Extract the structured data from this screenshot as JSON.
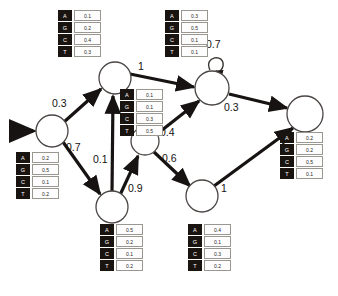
{
  "diagram": {
    "alphabet": [
      "A",
      "G",
      "C",
      "T"
    ],
    "nodes": [
      {
        "id": "start",
        "label": "",
        "cx": 52,
        "cy": 131,
        "r": 16
      },
      {
        "id": "top",
        "label": "",
        "cx": 115,
        "cy": 78,
        "r": 16
      },
      {
        "id": "bottom",
        "label": "",
        "cx": 112,
        "cy": 207,
        "r": 16
      },
      {
        "id": "middle",
        "label": "",
        "cx": 145,
        "cy": 141,
        "r": 14
      },
      {
        "id": "upper",
        "label": "",
        "cx": 212,
        "cy": 88,
        "r": 17
      },
      {
        "id": "lower",
        "label": "",
        "cx": 202,
        "cy": 196,
        "r": 16
      },
      {
        "id": "end",
        "label": "",
        "cx": 305,
        "cy": 114,
        "r": 18
      }
    ],
    "edges": [
      {
        "from": "start",
        "to": "top",
        "weight": "0.3"
      },
      {
        "from": "start",
        "to": "bottom",
        "weight": "0.7"
      },
      {
        "from": "bottom",
        "to": "top",
        "weight": "0.1"
      },
      {
        "from": "bottom",
        "to": "middle",
        "weight": "0.9"
      },
      {
        "from": "top",
        "to": "upper",
        "weight": "1"
      },
      {
        "from": "middle",
        "to": "upper",
        "weight": "0.4"
      },
      {
        "from": "middle",
        "to": "lower",
        "weight": "0.6"
      },
      {
        "from": "upper",
        "to": "upper",
        "weight": "0.7"
      },
      {
        "from": "upper",
        "to": "end",
        "weight": "0.3"
      },
      {
        "from": "lower",
        "to": "end",
        "weight": "1"
      }
    ],
    "emissions": [
      {
        "node": "top",
        "values": [
          "0.1",
          "0.2",
          "0.4",
          "0.3"
        ]
      },
      {
        "node": "upper",
        "values": [
          "0.3",
          "0.5",
          "0.1",
          "0.1"
        ]
      },
      {
        "node": "middle",
        "values": [
          "0.1",
          "0.1",
          "0.3",
          "0.5"
        ]
      },
      {
        "node": "start",
        "values": [
          "0.2",
          "0.5",
          "0.1",
          "0.2"
        ]
      },
      {
        "node": "bottom",
        "values": [
          "0.5",
          "0.2",
          "0.1",
          "0.2"
        ]
      },
      {
        "node": "lower",
        "values": [
          "0.4",
          "0.1",
          "0.3",
          "0.2"
        ]
      },
      {
        "node": "end",
        "values": [
          "0.2",
          "0.2",
          "0.5",
          "0.1"
        ]
      }
    ],
    "colors": {
      "symbol_bg": "#1a1410",
      "symbol_fg": "#ffffff",
      "value_bg": "#fdfdfd",
      "value_border": "#9a9690",
      "edge": "#161312",
      "node_stroke": "#4a4644",
      "background": "#ffffff"
    }
  }
}
